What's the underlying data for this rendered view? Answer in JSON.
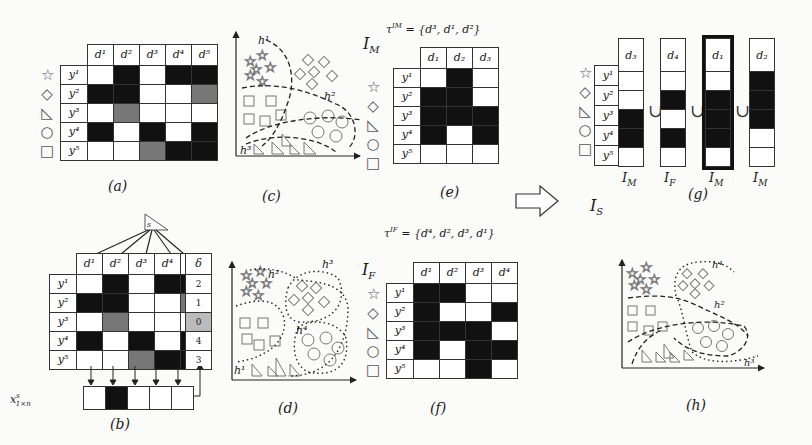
{
  "shapes": [
    "☆",
    "◇",
    "◺",
    "○",
    "□"
  ],
  "panel_a": {
    "caption": "(a)",
    "col_headers": [
      "d¹",
      "d²",
      "d³",
      "d⁴",
      "d⁵"
    ],
    "row_labels": [
      "y¹",
      "y²",
      "y³",
      "y⁴",
      "y⁵"
    ],
    "cells": [
      [
        "W",
        "B",
        "W",
        "B",
        "B"
      ],
      [
        "B",
        "B",
        "W",
        "W",
        "G"
      ],
      [
        "W",
        "G",
        "W",
        "W",
        "W"
      ],
      [
        "B",
        "W",
        "B",
        "W",
        "B"
      ],
      [
        "W",
        "W",
        "G",
        "B",
        "B"
      ]
    ]
  },
  "panel_b": {
    "caption": "(b)",
    "flag_label": "s",
    "col_headers": [
      "d¹",
      "d²",
      "d³",
      "d⁴",
      "d⁵"
    ],
    "row_labels": [
      "y¹",
      "y²",
      "y³",
      "y⁴",
      "y⁵"
    ],
    "cells": [
      [
        "W",
        "B",
        "W",
        "B",
        "B"
      ],
      [
        "B",
        "B",
        "W",
        "W",
        "G"
      ],
      [
        "W",
        "G",
        "W",
        "W",
        "W"
      ],
      [
        "B",
        "W",
        "B",
        "W",
        "B"
      ],
      [
        "W",
        "W",
        "G",
        "B",
        "B"
      ]
    ],
    "delta_header": "δ",
    "delta_values": [
      "2",
      "1",
      "0",
      "4",
      "3"
    ],
    "delta_highlight_index": 2,
    "x_label": "x",
    "x_sup": "s",
    "x_sub": "1×n",
    "x_vector": [
      "W",
      "B",
      "W",
      "W",
      "W"
    ]
  },
  "panel_c": {
    "caption": "(c)",
    "label": "I",
    "label_sub": "M",
    "hypotheses": [
      "h¹",
      "h²",
      "h³"
    ]
  },
  "panel_d": {
    "caption": "(d)",
    "label": "I",
    "label_sub": "F",
    "hypotheses": [
      "h¹",
      "h²",
      "h³",
      "h⁴"
    ]
  },
  "panel_e": {
    "caption": "(e)",
    "tau": "τ^{I_M} = {d³, d¹, d²}",
    "tau_text": "τ",
    "tau_sup": "IM",
    "tau_set": "= {d³, d¹, d²}",
    "col_headers": [
      "d₁",
      "d₂",
      "d₃"
    ],
    "row_labels": [
      "y¹",
      "y²",
      "y³",
      "y⁴",
      "y⁵"
    ],
    "cells": [
      [
        "W",
        "B",
        "W"
      ],
      [
        "B",
        "B",
        "W"
      ],
      [
        "B",
        "B",
        "B"
      ],
      [
        "B",
        "W",
        "B"
      ],
      [
        "W",
        "W",
        "W"
      ]
    ]
  },
  "panel_f": {
    "caption": "(f)",
    "tau_text": "τ",
    "tau_sup": "IF",
    "tau_set": "= {d⁴, d², d³, d¹}",
    "col_headers": [
      "d¹",
      "d²",
      "d³",
      "d⁴"
    ],
    "row_labels": [
      "y¹",
      "y²",
      "y³",
      "y⁴",
      "y⁵"
    ],
    "cells": [
      [
        "B",
        "B",
        "W",
        "W"
      ],
      [
        "B",
        "W",
        "W",
        "B"
      ],
      [
        "B",
        "B",
        "B",
        "W"
      ],
      [
        "B",
        "W",
        "B",
        "B"
      ],
      [
        "W",
        "W",
        "B",
        "W"
      ]
    ]
  },
  "panel_g": {
    "caption": "(g)",
    "row_labels": [
      "y¹",
      "y²",
      "y³",
      "y⁴",
      "y⁵"
    ],
    "union_symbol": "∪",
    "columns": [
      {
        "header": "d₃",
        "source": "I",
        "source_sub": "M",
        "cells": [
          "W",
          "W",
          "B",
          "B",
          "W"
        ],
        "bold": false
      },
      {
        "header": "d₄",
        "source": "I",
        "source_sub": "F",
        "cells": [
          "W",
          "B",
          "W",
          "B",
          "W"
        ],
        "bold": false
      },
      {
        "header": "d₁",
        "source": "I",
        "source_sub": "M",
        "cells": [
          "W",
          "B",
          "B",
          "B",
          "W"
        ],
        "bold": true
      },
      {
        "header": "d₂",
        "source": "I",
        "source_sub": "M",
        "cells": [
          "B",
          "B",
          "B",
          "W",
          "W"
        ],
        "bold": false
      }
    ]
  },
  "panel_h": {
    "caption": "(h)",
    "hypotheses": [
      "h²",
      "h³",
      "h⁴"
    ]
  },
  "transition": {
    "arrow": "⇨",
    "label": "I",
    "label_sub": "S"
  }
}
